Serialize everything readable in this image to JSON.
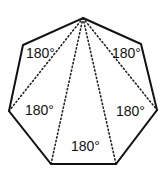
{
  "diagram": {
    "shape": "heptagon",
    "colors": {
      "outline": "#111111",
      "diagonal": "#222222",
      "background": "#ffffff"
    },
    "vertices": [
      {
        "x": 83,
        "y": 18
      },
      {
        "x": 141,
        "y": 44
      },
      {
        "x": 157,
        "y": 110
      },
      {
        "x": 116,
        "y": 164
      },
      {
        "x": 51,
        "y": 164
      },
      {
        "x": 9,
        "y": 111
      },
      {
        "x": 23,
        "y": 45
      }
    ],
    "triangles": [
      {
        "label": "180°",
        "x": 26,
        "y": 58
      },
      {
        "label": "180°",
        "x": 112,
        "y": 58
      },
      {
        "label": "180°",
        "x": 25,
        "y": 115
      },
      {
        "label": "180°",
        "x": 116,
        "y": 116
      },
      {
        "label": "180°",
        "x": 71,
        "y": 151
      }
    ]
  }
}
